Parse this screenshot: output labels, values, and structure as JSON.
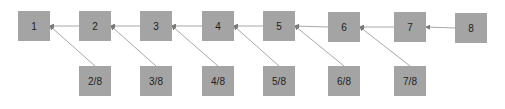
{
  "diagram": {
    "colors": {
      "node_fill": "#a4a4a4",
      "edge": "#a8a8a8",
      "text": "#1e1e1e",
      "background": "#ffffff"
    },
    "top_nodes": [
      {
        "id": "n1",
        "label": "1",
        "x": 18,
        "y": 11
      },
      {
        "id": "n2",
        "label": "2",
        "x": 79,
        "y": 11
      },
      {
        "id": "n3",
        "label": "3",
        "x": 140,
        "y": 11
      },
      {
        "id": "n4",
        "label": "4",
        "x": 202,
        "y": 11
      },
      {
        "id": "n5",
        "label": "5",
        "x": 263,
        "y": 11
      },
      {
        "id": "n6",
        "label": "6",
        "x": 328,
        "y": 12
      },
      {
        "id": "n7",
        "label": "7",
        "x": 394,
        "y": 12
      },
      {
        "id": "n8",
        "label": "8",
        "x": 455,
        "y": 13
      }
    ],
    "bottom_nodes": [
      {
        "id": "f2",
        "label": "2/8",
        "x": 79,
        "y": 66
      },
      {
        "id": "f3",
        "label": "3/8",
        "x": 140,
        "y": 66
      },
      {
        "id": "f4",
        "label": "4/8",
        "x": 202,
        "y": 66
      },
      {
        "id": "f5",
        "label": "5/8",
        "x": 263,
        "y": 66
      },
      {
        "id": "f6",
        "label": "6/8",
        "x": 328,
        "y": 66
      },
      {
        "id": "f7",
        "label": "7/8",
        "x": 394,
        "y": 66
      }
    ],
    "edges": [
      {
        "from": "n2",
        "to": "n1"
      },
      {
        "from": "n3",
        "to": "n2"
      },
      {
        "from": "n4",
        "to": "n3"
      },
      {
        "from": "n5",
        "to": "n4"
      },
      {
        "from": "n6",
        "to": "n5"
      },
      {
        "from": "n7",
        "to": "n6"
      },
      {
        "from": "n8",
        "to": "n7"
      },
      {
        "from": "f2",
        "to": "n1"
      },
      {
        "from": "f3",
        "to": "n2"
      },
      {
        "from": "f4",
        "to": "n3"
      },
      {
        "from": "f5",
        "to": "n4"
      },
      {
        "from": "f6",
        "to": "n5"
      },
      {
        "from": "f7",
        "to": "n6"
      }
    ]
  }
}
